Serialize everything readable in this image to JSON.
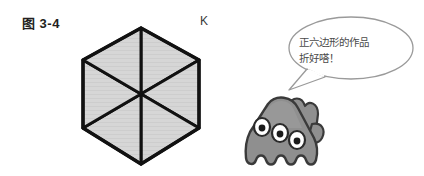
{
  "figure": {
    "caption": "图 3-4",
    "vertex_label": "K"
  },
  "shape": {
    "name": "regular-hexagon",
    "sides": 6,
    "triangles": 6,
    "fill_color": "#d6d6d6",
    "stroke_color": "#111111"
  },
  "character": {
    "name": "three-eyed-monster",
    "eyes": 3,
    "body_color": "#8c8c8c",
    "outline_color": "#333333"
  },
  "speech_bubble": {
    "line1": "正六边形的作品",
    "line2": "折好嗒！",
    "border_color": "#9a9a9a",
    "fill_color": "#ffffff"
  }
}
